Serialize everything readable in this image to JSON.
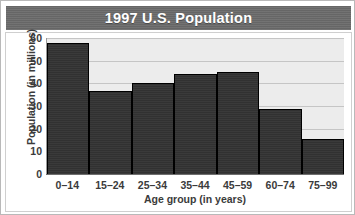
{
  "chart_data": {
    "type": "bar",
    "title": "1997 U.S. Population",
    "xlabel": "Age group (in years)",
    "ylabel": "Population (in millions)",
    "categories": [
      "0–14",
      "15–24",
      "25–34",
      "35–44",
      "45–59",
      "60–74",
      "75–99"
    ],
    "values": [
      58,
      36.5,
      40,
      44,
      45,
      28.5,
      15.5
    ],
    "ylim": [
      0,
      60
    ],
    "yticks": [
      0,
      10,
      20,
      30,
      40,
      50,
      60
    ],
    "ytick_labels": [
      "0",
      "10",
      "20",
      "30",
      "40",
      "50",
      "60"
    ],
    "grid": true,
    "legend": false,
    "series": [
      {
        "name": "Population",
        "values": [
          58,
          36.5,
          40,
          44,
          45,
          28.5,
          15.5
        ]
      }
    ],
    "colors": {
      "bar_fill": "#333333",
      "bar_edge": "#000000",
      "plot_background": "#ececec",
      "gridline": "#c5c5c5",
      "title_background": "#6b6b6b",
      "title_text": "#ffffff",
      "axis_text": "#3b3b3b",
      "figure_background": "#ffffff"
    }
  }
}
